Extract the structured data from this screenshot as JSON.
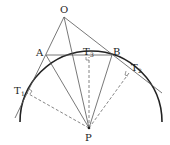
{
  "diagram": {
    "points": {
      "O": {
        "label": "O",
        "x": 64,
        "y": 17
      },
      "A": {
        "label": "A",
        "x": 46,
        "y": 55
      },
      "B": {
        "label": "B",
        "x": 112,
        "y": 55
      },
      "T1": {
        "label": "T",
        "sub": "1",
        "x": 27,
        "y": 92
      },
      "T2": {
        "label": "T",
        "sub": "2",
        "x": 129,
        "y": 73
      },
      "T3": {
        "label": "T",
        "sub": "3",
        "x": 89,
        "y": 57
      },
      "P": {
        "label": "P",
        "x": 89,
        "y": 128
      }
    },
    "colors": {
      "line": "#555555",
      "arc": "#222222",
      "dashed": "#666666",
      "text": "#222222"
    }
  }
}
